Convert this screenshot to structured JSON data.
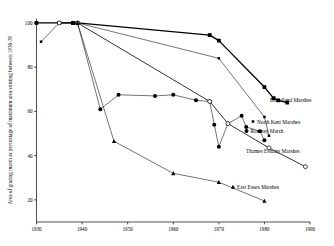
{
  "chart_data": {
    "type": "line",
    "title": "",
    "xlabel": "",
    "ylabel": "Area of grazing marsh as percentage of maximum area existing between 1930-39",
    "xlim": [
      1930,
      1990
    ],
    "ylim": [
      10,
      102
    ],
    "xticks": [
      1930,
      1940,
      1950,
      1960,
      1970,
      1980,
      1990
    ],
    "yticks": [
      20,
      40,
      60,
      80,
      100
    ],
    "xtick_labels": [
      "1930",
      "1940",
      "1950",
      "1960",
      "1970",
      "1980",
      "1990"
    ],
    "ytick_labels": [
      "20",
      "40",
      "60",
      "80",
      "100"
    ],
    "grid": false,
    "legend_position": "right-inline-labels",
    "series": [
      {
        "name": "Broadland Marshes",
        "marker": "filled-square",
        "linewidth": "thick",
        "x": [
          1930,
          1935,
          1938,
          1939,
          1968,
          1970,
          1980,
          1982,
          1983,
          1985
        ],
        "y": [
          100,
          100,
          100,
          100,
          94.5,
          92,
          71,
          66,
          65,
          64
        ]
      },
      {
        "name": "North Kent Marshes",
        "marker": "small-filled-square",
        "linewidth": "thin",
        "x": [
          1931,
          1935,
          1938,
          1939,
          1970,
          1980,
          1981
        ],
        "y": [
          91.5,
          100,
          100,
          100,
          84,
          57.5,
          49
        ]
      },
      {
        "name": "Romney Marsh",
        "marker": "filled-circle",
        "linewidth": "thin",
        "x": [
          1938,
          1939,
          1944,
          1948,
          1956,
          1960,
          1965,
          1968,
          1969,
          1970,
          1972,
          1975,
          1976,
          1979,
          1980
        ],
        "y": [
          100,
          100,
          61,
          67.5,
          67,
          67.5,
          65,
          64.5,
          54,
          44,
          54.5,
          58,
          53,
          51,
          47
        ]
      },
      {
        "name": "Thames Estuary Marshes",
        "marker": "open-circle",
        "linewidth": "medium",
        "x": [
          1935,
          1939,
          1968,
          1972,
          1981,
          1989
        ],
        "y": [
          100,
          100,
          64.5,
          54.5,
          43.5,
          35
        ]
      },
      {
        "name": "East Essex Marshes",
        "marker": "filled-triangle",
        "linewidth": "thin",
        "x": [
          1938,
          1939,
          1947,
          1960,
          1970,
          1980
        ],
        "y": [
          100,
          100,
          46.5,
          32,
          28,
          19.5
        ]
      }
    ],
    "annotations": [
      {
        "label": "Broadland Marshes",
        "marker": "filled-square"
      },
      {
        "label": "North Kent Marshes",
        "marker": "small-filled-square"
      },
      {
        "label": "Romney Marsh",
        "marker": "filled-circle"
      },
      {
        "label": "Thames Estuary Marshes",
        "marker": "open-circle"
      },
      {
        "label": "East Essex Marshes",
        "marker": "filled-triangle"
      }
    ]
  }
}
